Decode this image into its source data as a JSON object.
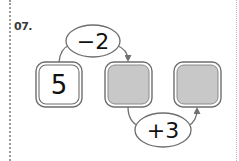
{
  "problem": {
    "number_label": "07."
  },
  "diagram": {
    "boxes": [
      {
        "value": "5",
        "filled": false
      },
      {
        "value": "",
        "filled": true
      },
      {
        "value": "",
        "filled": true
      }
    ],
    "operations": [
      {
        "label": "−2",
        "from_box": 0,
        "to_box": 1,
        "position": "top"
      },
      {
        "label": "+3",
        "from_box": 1,
        "to_box": 2,
        "position": "bottom"
      }
    ],
    "colors": {
      "box_border": "#6e6e6e",
      "blank_fill": "#c8c8c8",
      "line": "#707070",
      "text": "#111111"
    }
  }
}
